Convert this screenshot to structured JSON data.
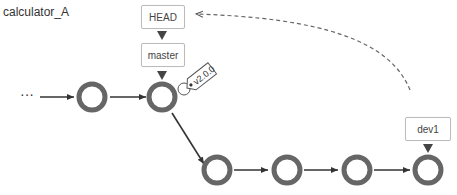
{
  "repo_name": "calculator_A",
  "refs": {
    "head": "HEAD",
    "master": "master",
    "dev1": "dev1",
    "tag": "v2.0.0"
  },
  "ellipsis": "···",
  "colors": {
    "commit_ring": "#666666",
    "arrow": "#333333",
    "box_border": "#bbbbbb"
  }
}
